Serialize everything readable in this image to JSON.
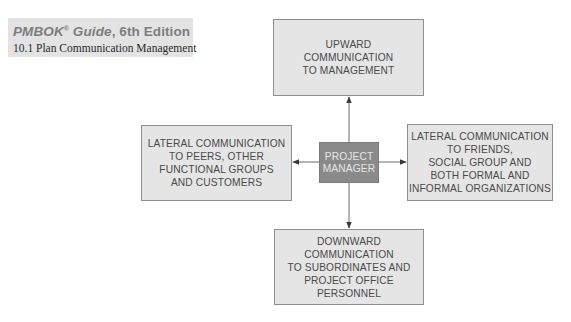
{
  "banner": {
    "title_italic": "PMBOK",
    "title_reg": "®",
    "title_guide": " Guide",
    "title_rest": ", 6th Edition",
    "subtitle": "10.1 Plan Communication Management"
  },
  "diagram": {
    "center": {
      "label": "PROJECT\nMANAGER",
      "fill": "#8a8a8a",
      "text_color": "#e6e6e6"
    },
    "nodes": {
      "up": {
        "label": "UPWARD\nCOMMUNICATION\nTO MANAGEMENT"
      },
      "left": {
        "label": "LATERAL COMMUNICATION\nTO PEERS, OTHER\nFUNCTIONAL GROUPS\nAND CUSTOMERS"
      },
      "right": {
        "label": "LATERAL COMMUNICATION\nTO FRIENDS,\nSOCIAL GROUP AND\nBOTH FORMAL AND\nINFORMAL ORGANIZATIONS"
      },
      "down": {
        "label": "DOWNWARD\nCOMMUNICATION\nTO SUBORDINATES AND\nPROJECT OFFICE\nPERSONNEL"
      }
    },
    "edges": [
      {
        "from": "center",
        "to": "up"
      },
      {
        "from": "center",
        "to": "left"
      },
      {
        "from": "center",
        "to": "right"
      },
      {
        "from": "center",
        "to": "down"
      }
    ],
    "colors": {
      "node_fill": "#e5e5e5",
      "node_border": "#8e8e8e",
      "node_text": "#4a4a4a",
      "arrow": "#6a6a6a",
      "banner_bg": "#e3e3e3"
    }
  }
}
